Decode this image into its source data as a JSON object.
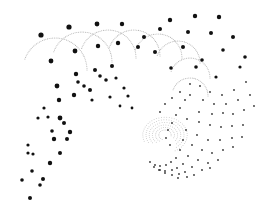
{
  "image": {
    "width": 266,
    "height": 216,
    "background": "#ffffff",
    "dot_color": "#111111",
    "faint_color": "#b8b8b8",
    "description": "Abstract dotted spiral pattern"
  },
  "large_dots": [
    [
      41,
      35,
      2.6
    ],
    [
      51,
      61,
      2.4
    ],
    [
      69,
      27,
      2.6
    ],
    [
      75,
      51,
      2.4
    ],
    [
      97,
      24,
      2.4
    ],
    [
      98,
      46,
      2.2
    ],
    [
      122,
      24,
      2.2
    ],
    [
      118,
      43,
      2.2
    ],
    [
      57,
      86,
      2.4
    ],
    [
      76,
      74,
      2.2
    ],
    [
      95,
      70,
      2.0
    ],
    [
      112,
      66,
      2.0
    ],
    [
      59,
      100,
      2.2
    ],
    [
      74,
      95,
      2.2
    ],
    [
      90,
      90,
      2.0
    ],
    [
      170,
      20,
      2.2
    ],
    [
      195,
      16,
      2.2
    ],
    [
      219,
      17,
      2.2
    ],
    [
      160,
      29,
      2.0
    ],
    [
      144,
      37,
      2.0
    ],
    [
      138,
      47,
      2.0
    ],
    [
      188,
      32,
      2.0
    ],
    [
      211,
      33,
      2.0
    ],
    [
      233,
      37,
      2.0
    ],
    [
      155,
      52,
      2.0
    ],
    [
      183,
      47,
      2.0
    ],
    [
      202,
      60,
      1.8
    ],
    [
      223,
      50,
      1.8
    ],
    [
      245,
      57,
      1.8
    ],
    [
      171,
      68,
      1.8
    ],
    [
      196,
      67,
      1.8
    ],
    [
      216,
      77,
      1.6
    ],
    [
      240,
      67,
      1.6
    ],
    [
      60,
      118,
      2.4
    ],
    [
      64,
      123,
      2.0
    ],
    [
      70,
      132,
      2.2
    ],
    [
      67,
      139,
      2.0
    ],
    [
      54,
      139,
      2.2
    ],
    [
      60,
      153,
      2.0
    ],
    [
      50,
      163,
      2.2
    ],
    [
      43,
      179,
      2.0
    ],
    [
      40,
      185,
      1.8
    ],
    [
      30,
      198,
      2.0
    ],
    [
      22,
      180,
      1.8
    ],
    [
      32,
      171,
      1.8
    ],
    [
      28,
      153,
      1.6
    ],
    [
      33,
      154,
      1.6
    ],
    [
      52,
      131,
      1.8
    ],
    [
      38,
      118,
      1.6
    ],
    [
      48,
      117,
      1.6
    ],
    [
      44,
      108,
      1.6
    ],
    [
      28,
      145,
      1.6
    ],
    [
      78,
      82,
      1.8
    ],
    [
      84,
      86,
      1.8
    ],
    [
      100,
      76,
      1.8
    ],
    [
      106,
      80,
      1.8
    ],
    [
      116,
      78,
      1.6
    ],
    [
      124,
      88,
      1.6
    ],
    [
      128,
      96,
      1.6
    ],
    [
      92,
      100,
      1.6
    ],
    [
      110,
      97,
      1.6
    ],
    [
      132,
      108,
      1.4
    ],
    [
      120,
      106,
      1.4
    ]
  ],
  "small_dots": [
    [
      199,
      112
    ],
    [
      212,
      114
    ],
    [
      223,
      113
    ],
    [
      233,
      114
    ],
    [
      244,
      110
    ],
    [
      254,
      106
    ],
    [
      187,
      119
    ],
    [
      199,
      122
    ],
    [
      210,
      125
    ],
    [
      221,
      127
    ],
    [
      232,
      126
    ],
    [
      243,
      125
    ],
    [
      186,
      130
    ],
    [
      197,
      135
    ],
    [
      208,
      140
    ],
    [
      220,
      140
    ],
    [
      232,
      138
    ],
    [
      242,
      137
    ],
    [
      183,
      140
    ],
    [
      192,
      145
    ],
    [
      202,
      150
    ],
    [
      212,
      153
    ],
    [
      223,
      150
    ],
    [
      233,
      147
    ],
    [
      180,
      150
    ],
    [
      188,
      156
    ],
    [
      198,
      160
    ],
    [
      208,
      163
    ],
    [
      218,
      160
    ],
    [
      176,
      158
    ],
    [
      183,
      164
    ],
    [
      192,
      167
    ],
    [
      202,
      170
    ],
    [
      210,
      168
    ],
    [
      171,
      162
    ],
    [
      177,
      168
    ],
    [
      185,
      172
    ],
    [
      194,
      175
    ],
    [
      166,
      165
    ],
    [
      172,
      170
    ],
    [
      179,
      174
    ],
    [
      187,
      177
    ],
    [
      160,
      166
    ],
    [
      165,
      171
    ],
    [
      172,
      175
    ],
    [
      178,
      178
    ],
    [
      155,
      165
    ],
    [
      159,
      170
    ],
    [
      165,
      173
    ],
    [
      150,
      162
    ],
    [
      154,
      167
    ],
    [
      160,
      170
    ],
    [
      176,
      115
    ],
    [
      180,
      108
    ],
    [
      172,
      123
    ],
    [
      168,
      130
    ],
    [
      166,
      138
    ],
    [
      170,
      145
    ],
    [
      185,
      100
    ],
    [
      190,
      95
    ],
    [
      180,
      92
    ],
    [
      172,
      98
    ],
    [
      165,
      104
    ],
    [
      160,
      112
    ],
    [
      246,
      82
    ],
    [
      234,
      90
    ],
    [
      222,
      95
    ],
    [
      210,
      92
    ],
    [
      200,
      86
    ],
    [
      190,
      84
    ],
    [
      250,
      95
    ],
    [
      238,
      100
    ],
    [
      226,
      104
    ],
    [
      214,
      104
    ],
    [
      203,
      100
    ]
  ],
  "arcs": [
    {
      "cx": 55,
      "cy": 70,
      "r": 32,
      "start": 200,
      "end": 360
    },
    {
      "cx": 82,
      "cy": 62,
      "r": 30,
      "start": 200,
      "end": 360
    },
    {
      "cx": 108,
      "cy": 58,
      "r": 28,
      "start": 200,
      "end": 360
    },
    {
      "cx": 134,
      "cy": 56,
      "r": 26,
      "start": 200,
      "end": 360
    },
    {
      "cx": 158,
      "cy": 58,
      "r": 24,
      "start": 200,
      "end": 360
    },
    {
      "cx": 178,
      "cy": 63,
      "r": 22,
      "start": 200,
      "end": 360
    },
    {
      "cx": 190,
      "cy": 78,
      "r": 20,
      "start": 200,
      "end": 360
    },
    {
      "cx": 190,
      "cy": 96,
      "r": 18,
      "start": 200,
      "end": 360
    }
  ],
  "swirl": {
    "cx": 165,
    "cy": 135,
    "rings": 6
  }
}
